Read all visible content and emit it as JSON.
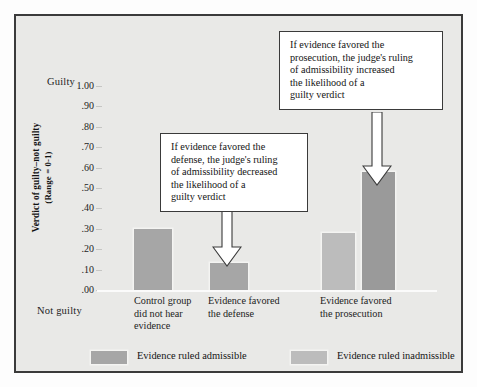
{
  "figure": {
    "background_color": "#e9e9e7",
    "frame_color": "#3b3b3b"
  },
  "axis": {
    "top_label": "Guilty",
    "bottom_label": "Not guilty",
    "title_line1": "Verdict of guilty–not guilty",
    "title_line2": "(Range = 0-1)",
    "tick_labels": [
      "1.00",
      ".90",
      ".80",
      ".70",
      ".60",
      ".50",
      ".40",
      ".30",
      ".20",
      ".10",
      ".00"
    ]
  },
  "callouts": [
    {
      "name": "defense-callout",
      "text": "If evidence favored the\ndefense, the judge's ruling\nof admissibility decreased\nthe likelihood of a\nguilty verdict"
    },
    {
      "name": "prosecution-callout",
      "text": "If evidence favored the\nprosecution, the judge's ruling\nof admissibility increased\nthe likelihood of a\nguilty verdict"
    }
  ],
  "legend": {
    "items": [
      {
        "label": "Evidence ruled admissible",
        "color": "#a6a6a6"
      },
      {
        "label": "Evidence ruled inadmissible",
        "color": "#bcbcbc"
      }
    ]
  },
  "chart_data": {
    "type": "bar",
    "title": "",
    "xlabel": "",
    "ylabel": "Verdict of guilty–not guilty (Range = 0-1)",
    "ylim": [
      0,
      1.0
    ],
    "ytick_values": [
      1.0,
      0.9,
      0.8,
      0.7,
      0.6,
      0.5,
      0.4,
      0.3,
      0.2,
      0.1,
      0.0
    ],
    "grid": false,
    "legend_position": "bottom",
    "categories": [
      "Control group\ndid not hear\nevidence",
      "Evidence favored\nthe defense",
      "Evidence favored\nthe prosecution"
    ],
    "series": [
      {
        "name": "Evidence ruled admissible",
        "color": "#a6a6a6",
        "values": [
          0.3,
          0.13,
          0.28
        ]
      },
      {
        "name": "Evidence ruled inadmissible",
        "color": "#bcbcbc",
        "values": [
          null,
          null,
          0.58
        ]
      }
    ],
    "bars": [
      {
        "name": "control-bar",
        "category": "Control group did not hear evidence",
        "series": "Evidence ruled admissible",
        "value": 0.3,
        "x": 37,
        "width": 38,
        "color": "#a6a6a6"
      },
      {
        "name": "defense-bar",
        "category": "Evidence favored the defense",
        "series": "Evidence ruled admissible",
        "value": 0.13,
        "x": 113,
        "width": 38,
        "color": "#a6a6a6"
      },
      {
        "name": "prosecution-admissible-bar",
        "category": "Evidence favored the prosecution",
        "series": "Evidence ruled admissible",
        "value": 0.28,
        "x": 225,
        "width": 33,
        "color": "#bcbcbc"
      },
      {
        "name": "prosecution-inadmissible-bar",
        "category": "Evidence favored the prosecution",
        "series": "Evidence ruled inadmissible",
        "value": 0.58,
        "x": 265,
        "width": 33,
        "color": "#9a9a9a"
      }
    ]
  }
}
